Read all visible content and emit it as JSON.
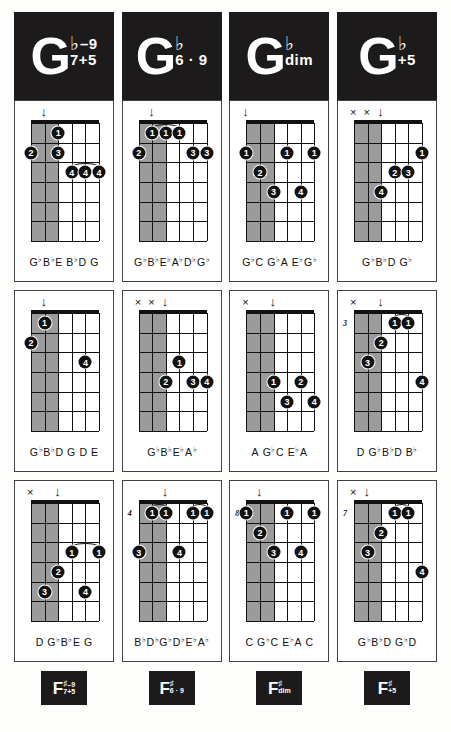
{
  "page": {
    "accent_color": "#1c1a1b",
    "shade_color": "#9b9b9b",
    "paper_color": "#fdfdfc"
  },
  "columns": [
    {
      "header": {
        "root": "G",
        "accidental": "♭",
        "sup": "–9",
        "sub": "7+5"
      },
      "footer": {
        "root": "F",
        "accidental": "♯",
        "sup": "–9",
        "sub": "7+5"
      },
      "diagrams": [
        {
          "base_fret": "",
          "markers": [
            {
              "type": "arrow",
              "glyph": "↓",
              "string": 2
            }
          ],
          "dots": [
            {
              "string": 3,
              "fret": 1,
              "finger": "1"
            },
            {
              "string": 1,
              "fret": 2,
              "finger": "2"
            },
            {
              "string": 3,
              "fret": 2,
              "finger": "3"
            },
            {
              "string": 4,
              "fret": 3,
              "finger": "4"
            },
            {
              "string": 5,
              "fret": 3,
              "finger": "4"
            },
            {
              "string": 6,
              "fret": 3,
              "finger": "4"
            }
          ],
          "barres": [
            {
              "fret": 3,
              "from": 4,
              "to": 6
            }
          ],
          "shaded_strings": [
            1,
            2,
            3
          ],
          "notes": "G♭B♭E B♭D G",
          "note_tokens": [
            {
              "t": "G",
              "f": "♭"
            },
            {
              "t": "B",
              "f": "♭"
            },
            {
              "t": "E",
              "f": ""
            },
            {
              "t": " B",
              "f": "♭"
            },
            {
              "t": "D",
              "f": ""
            },
            {
              "t": " G",
              "f": ""
            }
          ]
        },
        {
          "base_fret": "",
          "markers": [
            {
              "type": "arrow",
              "glyph": "↓",
              "string": 2
            }
          ],
          "dots": [
            {
              "string": 2,
              "fret": 1,
              "finger": "1"
            },
            {
              "string": 1,
              "fret": 2,
              "finger": "2"
            },
            {
              "string": 5,
              "fret": 3,
              "finger": "4"
            }
          ],
          "barres": [],
          "shaded_strings": [
            1,
            2,
            3
          ],
          "notes": "G♭B♭D G D E",
          "note_tokens": [
            {
              "t": "G",
              "f": "♭"
            },
            {
              "t": "B",
              "f": "♭"
            },
            {
              "t": "D",
              "f": ""
            },
            {
              "t": " G",
              "f": ""
            },
            {
              "t": " D",
              "f": ""
            },
            {
              "t": " E",
              "f": ""
            }
          ]
        },
        {
          "base_fret": "",
          "markers": [
            {
              "type": "x",
              "glyph": "×",
              "string": 1
            },
            {
              "type": "arrow",
              "glyph": "↓",
              "string": 3
            }
          ],
          "dots": [
            {
              "string": 4,
              "fret": 3,
              "finger": "1"
            },
            {
              "string": 6,
              "fret": 3,
              "finger": "1"
            },
            {
              "string": 3,
              "fret": 4,
              "finger": "2"
            },
            {
              "string": 2,
              "fret": 5,
              "finger": "3"
            },
            {
              "string": 5,
              "fret": 5,
              "finger": "4"
            }
          ],
          "barres": [
            {
              "fret": 3,
              "from": 4,
              "to": 6
            }
          ],
          "shaded_strings": [
            1,
            2,
            3
          ],
          "notes": "D G♭B♭E G",
          "note_tokens": [
            {
              "t": "D",
              "f": ""
            },
            {
              "t": " G",
              "f": "♭"
            },
            {
              "t": "B",
              "f": "♭"
            },
            {
              "t": "E",
              "f": ""
            },
            {
              "t": " G",
              "f": ""
            }
          ]
        }
      ]
    },
    {
      "header": {
        "root": "G",
        "accidental": "♭",
        "sup": "",
        "sub": "6 · 9"
      },
      "footer": {
        "root": "F",
        "accidental": "♯",
        "sup": "",
        "sub": "6 · 9"
      },
      "diagrams": [
        {
          "base_fret": "",
          "markers": [
            {
              "type": "arrow",
              "glyph": "↓",
              "string": 2
            }
          ],
          "dots": [
            {
              "string": 2,
              "fret": 1,
              "finger": "1"
            },
            {
              "string": 3,
              "fret": 1,
              "finger": "1"
            },
            {
              "string": 4,
              "fret": 1,
              "finger": "1"
            },
            {
              "string": 1,
              "fret": 2,
              "finger": "2"
            },
            {
              "string": 5,
              "fret": 2,
              "finger": "3"
            },
            {
              "string": 6,
              "fret": 2,
              "finger": "3"
            }
          ],
          "barres": [
            {
              "fret": 1,
              "from": 2,
              "to": 4
            }
          ],
          "shaded_strings": [
            1,
            2,
            3
          ],
          "notes": "G♭B♭E♭A♭D♭G♭",
          "note_tokens": [
            {
              "t": "G",
              "f": "♭"
            },
            {
              "t": "B",
              "f": "♭"
            },
            {
              "t": "E",
              "f": "♭"
            },
            {
              "t": "A",
              "f": "♭"
            },
            {
              "t": "D",
              "f": "♭"
            },
            {
              "t": "G",
              "f": "♭"
            }
          ]
        },
        {
          "base_fret": "",
          "markers": [
            {
              "type": "x",
              "glyph": "×",
              "string": 1
            },
            {
              "type": "x",
              "glyph": "×",
              "string": 2
            },
            {
              "type": "arrow",
              "glyph": "↓",
              "string": 3
            }
          ],
          "dots": [
            {
              "string": 4,
              "fret": 3,
              "finger": "1"
            },
            {
              "string": 3,
              "fret": 4,
              "finger": "2"
            },
            {
              "string": 5,
              "fret": 4,
              "finger": "3"
            },
            {
              "string": 6,
              "fret": 4,
              "finger": "4"
            }
          ],
          "barres": [],
          "shaded_strings": [
            1,
            2,
            3
          ],
          "notes": "G♭B♭E♭A♭",
          "note_tokens": [
            {
              "t": "G",
              "f": "♭"
            },
            {
              "t": "B",
              "f": "♭"
            },
            {
              "t": "E",
              "f": "♭"
            },
            {
              "t": "A",
              "f": "♭"
            }
          ]
        },
        {
          "base_fret": "4",
          "markers": [
            {
              "type": "arrow",
              "glyph": "↓",
              "string": 3
            }
          ],
          "dots": [
            {
              "string": 2,
              "fret": 1,
              "finger": "1"
            },
            {
              "string": 3,
              "fret": 1,
              "finger": "1"
            },
            {
              "string": 5,
              "fret": 1,
              "finger": "1"
            },
            {
              "string": 6,
              "fret": 1,
              "finger": "1"
            },
            {
              "string": 1,
              "fret": 3,
              "finger": "3"
            },
            {
              "string": 4,
              "fret": 3,
              "finger": "4"
            }
          ],
          "barres": [
            {
              "fret": 1,
              "from": 2,
              "to": 3
            },
            {
              "fret": 1,
              "from": 5,
              "to": 6
            }
          ],
          "shaded_strings": [
            1,
            2,
            3
          ],
          "notes": "B♭D♭G♭D♭E♭A♭",
          "note_tokens": [
            {
              "t": "B",
              "f": "♭"
            },
            {
              "t": "D",
              "f": "♭"
            },
            {
              "t": "G",
              "f": "♭"
            },
            {
              "t": "D",
              "f": "♭"
            },
            {
              "t": "E",
              "f": "♭"
            },
            {
              "t": "A",
              "f": "♭"
            }
          ]
        }
      ]
    },
    {
      "header": {
        "root": "G",
        "accidental": "♭",
        "sup": "",
        "sub": "dim"
      },
      "footer": {
        "root": "F",
        "accidental": "♯",
        "sup": "",
        "sub": "dim"
      },
      "diagrams": [
        {
          "base_fret": "",
          "markers": [
            {
              "type": "arrow",
              "glyph": "↓",
              "string": 1
            }
          ],
          "dots": [
            {
              "string": 1,
              "fret": 2,
              "finger": "1"
            },
            {
              "string": 4,
              "fret": 2,
              "finger": "1"
            },
            {
              "string": 6,
              "fret": 2,
              "finger": "1"
            },
            {
              "string": 2,
              "fret": 3,
              "finger": "2"
            },
            {
              "string": 3,
              "fret": 4,
              "finger": "3"
            },
            {
              "string": 5,
              "fret": 4,
              "finger": "4"
            }
          ],
          "barres": [],
          "shaded_strings": [
            1,
            2,
            3
          ],
          "notes": "G♭C G♭A E♭G♭",
          "note_tokens": [
            {
              "t": "G",
              "f": "♭"
            },
            {
              "t": "C",
              "f": ""
            },
            {
              "t": " G",
              "f": "♭"
            },
            {
              "t": "A",
              "f": ""
            },
            {
              "t": " E",
              "f": "♭"
            },
            {
              "t": "G",
              "f": "♭"
            }
          ]
        },
        {
          "base_fret": "",
          "markers": [
            {
              "type": "x",
              "glyph": "×",
              "string": 1
            },
            {
              "type": "arrow",
              "glyph": "↓",
              "string": 3
            }
          ],
          "dots": [
            {
              "string": 3,
              "fret": 4,
              "finger": "1"
            },
            {
              "string": 5,
              "fret": 4,
              "finger": "2"
            },
            {
              "string": 4,
              "fret": 5,
              "finger": "3"
            },
            {
              "string": 6,
              "fret": 5,
              "finger": "4"
            }
          ],
          "barres": [],
          "shaded_strings": [
            1,
            2,
            3
          ],
          "notes": "A G♭C E♭A",
          "note_tokens": [
            {
              "t": "A",
              "f": ""
            },
            {
              "t": " G",
              "f": "♭"
            },
            {
              "t": "C",
              "f": ""
            },
            {
              "t": " E",
              "f": "♭"
            },
            {
              "t": "A",
              "f": ""
            }
          ]
        },
        {
          "base_fret": "8",
          "markers": [
            {
              "type": "arrow",
              "glyph": "↓",
              "string": 2
            }
          ],
          "dots": [
            {
              "string": 1,
              "fret": 1,
              "finger": "1"
            },
            {
              "string": 4,
              "fret": 1,
              "finger": "1"
            },
            {
              "string": 6,
              "fret": 1,
              "finger": "1"
            },
            {
              "string": 2,
              "fret": 2,
              "finger": "2"
            },
            {
              "string": 3,
              "fret": 3,
              "finger": "3"
            },
            {
              "string": 5,
              "fret": 3,
              "finger": "4"
            }
          ],
          "barres": [],
          "shaded_strings": [
            1,
            2,
            3
          ],
          "notes": "C G♭C E♭A C",
          "note_tokens": [
            {
              "t": "C",
              "f": ""
            },
            {
              "t": " G",
              "f": "♭"
            },
            {
              "t": "C",
              "f": ""
            },
            {
              "t": " E",
              "f": "♭"
            },
            {
              "t": "A",
              "f": ""
            },
            {
              "t": " C",
              "f": ""
            }
          ]
        }
      ]
    },
    {
      "header": {
        "root": "G",
        "accidental": "♭",
        "sup": "",
        "sub": "+5"
      },
      "footer": {
        "root": "F",
        "accidental": "♯",
        "sup": "",
        "sub": "+5"
      },
      "diagrams": [
        {
          "base_fret": "",
          "markers": [
            {
              "type": "x",
              "glyph": "×",
              "string": 1
            },
            {
              "type": "x",
              "glyph": "×",
              "string": 2
            },
            {
              "type": "arrow",
              "glyph": "↓",
              "string": 3
            }
          ],
          "dots": [
            {
              "string": 6,
              "fret": 2,
              "finger": "1"
            },
            {
              "string": 4,
              "fret": 3,
              "finger": "2"
            },
            {
              "string": 5,
              "fret": 3,
              "finger": "3"
            },
            {
              "string": 3,
              "fret": 4,
              "finger": "4"
            }
          ],
          "barres": [],
          "shaded_strings": [
            1,
            2,
            3
          ],
          "notes": "G♭B♭D G♭",
          "note_tokens": [
            {
              "t": "G",
              "f": "♭"
            },
            {
              "t": "B",
              "f": "♭"
            },
            {
              "t": "D",
              "f": ""
            },
            {
              "t": " G",
              "f": "♭"
            }
          ]
        },
        {
          "base_fret": "3",
          "markers": [
            {
              "type": "x",
              "glyph": "×",
              "string": 1
            },
            {
              "type": "arrow",
              "glyph": "↓",
              "string": 3
            }
          ],
          "dots": [
            {
              "string": 4,
              "fret": 1,
              "finger": "1"
            },
            {
              "string": 5,
              "fret": 1,
              "finger": "1"
            },
            {
              "string": 3,
              "fret": 2,
              "finger": "2"
            },
            {
              "string": 2,
              "fret": 3,
              "finger": "3"
            },
            {
              "string": 6,
              "fret": 4,
              "finger": "4"
            }
          ],
          "barres": [
            {
              "fret": 1,
              "from": 4,
              "to": 5
            }
          ],
          "shaded_strings": [
            1,
            2,
            3
          ],
          "notes": "D G♭B♭D B♭",
          "note_tokens": [
            {
              "t": "D",
              "f": ""
            },
            {
              "t": " G",
              "f": "♭"
            },
            {
              "t": "B",
              "f": "♭"
            },
            {
              "t": "D",
              "f": ""
            },
            {
              "t": " B",
              "f": "♭"
            }
          ]
        },
        {
          "base_fret": "7",
          "markers": [
            {
              "type": "x",
              "glyph": "×",
              "string": 1
            },
            {
              "type": "arrow",
              "glyph": "↓",
              "string": 2
            }
          ],
          "dots": [
            {
              "string": 4,
              "fret": 1,
              "finger": "1"
            },
            {
              "string": 5,
              "fret": 1,
              "finger": "1"
            },
            {
              "string": 3,
              "fret": 2,
              "finger": "2"
            },
            {
              "string": 2,
              "fret": 3,
              "finger": "3"
            },
            {
              "string": 6,
              "fret": 4,
              "finger": "4"
            }
          ],
          "barres": [
            {
              "fret": 1,
              "from": 4,
              "to": 5
            }
          ],
          "shaded_strings": [
            1,
            2,
            3
          ],
          "notes": "G♭B♭D G♭D",
          "note_tokens": [
            {
              "t": "G",
              "f": "♭"
            },
            {
              "t": "B",
              "f": "♭"
            },
            {
              "t": "D",
              "f": ""
            },
            {
              "t": " G",
              "f": "♭"
            },
            {
              "t": "D",
              "f": ""
            }
          ]
        }
      ]
    }
  ]
}
